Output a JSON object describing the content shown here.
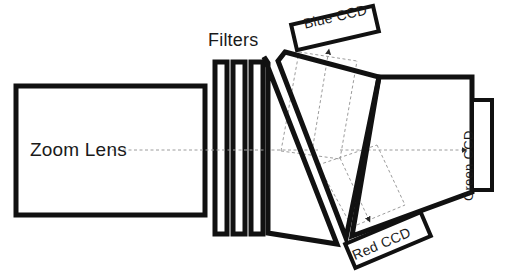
{
  "figure": {
    "type": "optical-schematic",
    "title_visible": false,
    "background_color": "#ffffff",
    "stroke_color": "#111111",
    "ray_color": "#9a9a9a",
    "width": 506,
    "height": 272
  },
  "labels": {
    "zoom_lens": "Zoom Lens",
    "filters": "Filters",
    "blue_ccd": "Blue CCD",
    "red_ccd": "Red CCD",
    "green_ccd": "Green CCD"
  },
  "components": [
    {
      "id": "zoom-lens",
      "name": "Zoom Lens",
      "shape": "rectangle",
      "x": 16,
      "y": 86,
      "width": 189,
      "height": 129
    },
    {
      "id": "filter-1",
      "name": "Filter 1",
      "shape": "rectangle",
      "x": 215,
      "y": 62,
      "width": 12,
      "height": 172
    },
    {
      "id": "filter-2",
      "name": "Filter 2",
      "shape": "rectangle",
      "x": 233,
      "y": 62,
      "width": 12,
      "height": 172
    },
    {
      "id": "filter-3",
      "name": "Filter 3",
      "shape": "rectangle",
      "x": 251,
      "y": 62,
      "width": 12,
      "height": 172
    },
    {
      "id": "prism-1",
      "name": "Blue dichroic prism",
      "shape": "quadrilateral",
      "points": "268,62 268,232 336,243 264,57"
    },
    {
      "id": "prism-2",
      "name": "Red dichroic prism",
      "shape": "quadrilateral",
      "points": "284,52 378,76 345,237 277,60"
    },
    {
      "id": "prism-3",
      "name": "Green transmission prism",
      "shape": "quadrilateral",
      "points": "378,76 472,76 472,196 352,236"
    },
    {
      "id": "blue-ccd",
      "name": "Blue CCD sensor",
      "shape": "rotated-rectangle",
      "center_x": 335,
      "center_y": 28,
      "width": 84,
      "height": 26,
      "rotation_deg": -13
    },
    {
      "id": "red-ccd",
      "name": "Red CCD sensor",
      "shape": "rotated-rectangle",
      "center_x": 388,
      "center_y": 240,
      "width": 82,
      "height": 26,
      "rotation_deg": -23
    },
    {
      "id": "green-ccd",
      "name": "Green CCD sensor",
      "shape": "rectangle",
      "x": 472,
      "y": 100,
      "width": 20,
      "height": 90,
      "rotation_deg": -90
    }
  ],
  "ray_paths": [
    {
      "id": "optical-axis",
      "name": "Optical axis (incoming beam)",
      "style": "dashed",
      "from_x": 112,
      "from_y": 150,
      "to_x": 312,
      "to_y": 150
    },
    {
      "id": "blue-ray",
      "name": "Blue reflected beam",
      "style": "dashed",
      "color": "blue-channel",
      "arrow": true,
      "from_x": 312,
      "from_y": 150,
      "to_x": 330,
      "to_y": 46
    },
    {
      "id": "red-ray",
      "name": "Red reflected beam",
      "style": "dashed",
      "color": "red-channel",
      "arrow": true,
      "from_x": 340,
      "from_y": 158,
      "to_x": 371,
      "to_y": 224
    },
    {
      "id": "green-ray",
      "name": "Green transmitted beam",
      "style": "dashed",
      "color": "green-channel",
      "arrow": true,
      "from_x": 340,
      "from_y": 150,
      "to_x": 468,
      "to_y": 150
    }
  ]
}
